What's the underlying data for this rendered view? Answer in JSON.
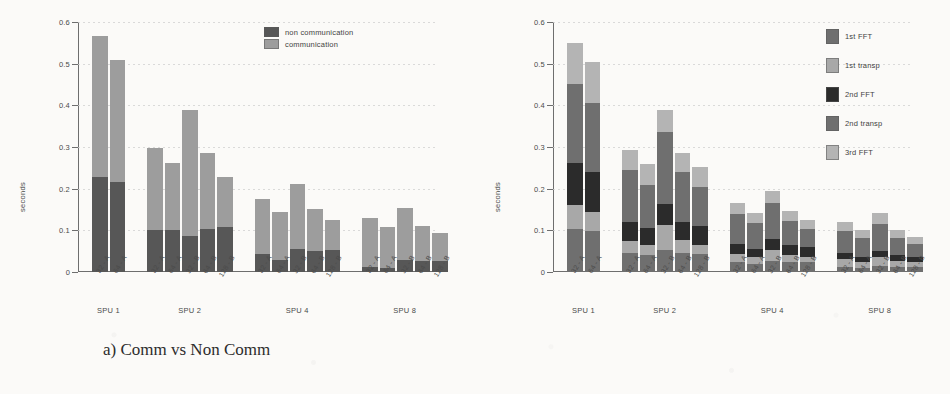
{
  "figure": {
    "ylabel": "seconds",
    "ytick_labels": [
      "0",
      "0.1",
      "0.2",
      "0.3",
      "0.4",
      "0.5",
      "0.6"
    ],
    "group_labels": [
      "SPU 1",
      "SPU 2",
      "SPU 4",
      "SPU 8"
    ],
    "xtick_labels_spu1": [
      "32 - A",
      "64 - A"
    ],
    "xtick_labels_rest": [
      "32 - A",
      "64 - A",
      "32 - B",
      "64 - B",
      "128 - B"
    ],
    "caption_a": "a) Comm vs Non Comm",
    "caption_b": "b) Steps"
  },
  "colors": {
    "non_communication": "#575757",
    "communication": "#9d9d9d",
    "step_1st_fft": "#6f6f6f",
    "step_1st_transp": "#a8a8a8",
    "step_2nd_fft": "#2b2b2b",
    "step_2nd_transp": "#6f6f6f",
    "step_3rd_fft": "#b4b4b4",
    "axis": "#6e6e6e",
    "grid": "#cfcfcf",
    "paper": "#fbfaf8"
  },
  "chart_data": [
    {
      "type": "bar",
      "id": "chart-a",
      "title": "a) Comm vs Non Comm",
      "stacked": true,
      "xlabel": "",
      "ylabel": "seconds",
      "ylim": [
        0,
        0.6
      ],
      "yticks": [
        0,
        0.1,
        0.2,
        0.3,
        0.4,
        0.5,
        0.6
      ],
      "grid": true,
      "legend_position": "top-right",
      "groups": [
        "SPU 1",
        "SPU 2",
        "SPU 4",
        "SPU 8"
      ],
      "categories": [
        "32 - A",
        "64 - A",
        "32 - A",
        "64 - A",
        "32 - B",
        "64 - B",
        "128 - B",
        "32 - A",
        "64 - A",
        "32 - B",
        "64 - B",
        "128 - B",
        "32 - A",
        "64 - A",
        "32 - B",
        "64 - B",
        "128 - B"
      ],
      "series": [
        {
          "name": "non communication",
          "color": "#575757",
          "values": [
            0.227,
            0.216,
            0.101,
            0.101,
            0.087,
            0.104,
            0.107,
            0.043,
            0.03,
            0.055,
            0.05,
            0.053,
            0.013,
            0.009,
            0.03,
            0.026,
            0.027
          ]
        },
        {
          "name": "communication",
          "color": "#9d9d9d",
          "values": [
            0.34,
            0.294,
            0.196,
            0.161,
            0.301,
            0.182,
            0.121,
            0.133,
            0.115,
            0.157,
            0.101,
            0.072,
            0.117,
            0.098,
            0.124,
            0.084,
            0.066
          ]
        }
      ],
      "totals": [
        0.567,
        0.51,
        0.297,
        0.262,
        0.388,
        0.286,
        0.228,
        0.176,
        0.145,
        0.212,
        0.151,
        0.125,
        0.13,
        0.107,
        0.154,
        0.11,
        0.093
      ]
    },
    {
      "type": "bar",
      "id": "chart-b",
      "title": "b) Steps",
      "stacked": true,
      "xlabel": "",
      "ylabel": "seconds",
      "ylim": [
        0,
        0.6
      ],
      "yticks": [
        0,
        0.1,
        0.2,
        0.3,
        0.4,
        0.5,
        0.6
      ],
      "grid": true,
      "legend_position": "right",
      "groups": [
        "SPU 1",
        "SPU 2",
        "SPU 4",
        "SPU 8"
      ],
      "categories": [
        "32 - A",
        "64 - A",
        "32 - A",
        "64 - A",
        "32 - B",
        "64 - B",
        "128 - B",
        "32 - A",
        "64 - A",
        "32 - B",
        "64 - B",
        "128 - B",
        "32 - A",
        "64 - A",
        "32 - B",
        "64 - B",
        "128 - B"
      ],
      "series": [
        {
          "name": "1st FFT",
          "color": "#6f6f6f",
          "values": [
            0.103,
            0.099,
            0.046,
            0.04,
            0.052,
            0.045,
            0.044,
            0.023,
            0.02,
            0.026,
            0.024,
            0.023,
            0.013,
            0.01,
            0.015,
            0.013,
            0.012
          ]
        },
        {
          "name": "1st transp",
          "color": "#a8a8a8",
          "values": [
            0.057,
            0.044,
            0.028,
            0.025,
            0.06,
            0.031,
            0.022,
            0.021,
            0.016,
            0.027,
            0.017,
            0.013,
            0.019,
            0.015,
            0.021,
            0.014,
            0.011
          ]
        },
        {
          "name": "2nd FFT",
          "color": "#2b2b2b",
          "values": [
            0.102,
            0.098,
            0.046,
            0.04,
            0.052,
            0.045,
            0.044,
            0.023,
            0.02,
            0.026,
            0.024,
            0.023,
            0.013,
            0.01,
            0.015,
            0.013,
            0.012
          ]
        },
        {
          "name": "2nd transp",
          "color": "#6f6f6f",
          "values": [
            0.189,
            0.165,
            0.124,
            0.105,
            0.172,
            0.119,
            0.093,
            0.073,
            0.061,
            0.086,
            0.058,
            0.045,
            0.054,
            0.046,
            0.065,
            0.042,
            0.033
          ]
        },
        {
          "name": "3rd FFT",
          "color": "#b4b4b4",
          "values": [
            0.098,
            0.098,
            0.05,
            0.05,
            0.052,
            0.046,
            0.049,
            0.025,
            0.024,
            0.03,
            0.024,
            0.021,
            0.02,
            0.019,
            0.025,
            0.02,
            0.017
          ]
        }
      ],
      "totals": [
        0.549,
        0.504,
        0.294,
        0.26,
        0.388,
        0.286,
        0.252,
        0.165,
        0.141,
        0.195,
        0.147,
        0.125,
        0.119,
        0.1,
        0.141,
        0.102,
        0.085
      ]
    }
  ],
  "legend_a": {
    "items": [
      {
        "label": "non communication",
        "color": "#575757"
      },
      {
        "label": "communication",
        "color": "#9d9d9d"
      }
    ]
  },
  "legend_b": {
    "items": [
      {
        "label": "1st FFT",
        "color": "#6f6f6f"
      },
      {
        "label": "1st transp",
        "color": "#a8a8a8"
      },
      {
        "label": "2nd FFT",
        "color": "#2b2b2b"
      },
      {
        "label": "2nd transp",
        "color": "#6f6f6f"
      },
      {
        "label": "3rd FFT",
        "color": "#b4b4b4"
      }
    ]
  }
}
